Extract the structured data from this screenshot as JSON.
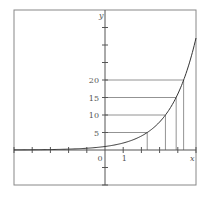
{
  "chart_data": {
    "type": "line",
    "title": "",
    "function": "y = 2^x",
    "xlabel": "x",
    "ylabel": "y",
    "xlim": [
      -5,
      5
    ],
    "ylim": [
      -10,
      40
    ],
    "grid": false,
    "x_ticks": [
      -5,
      -4,
      -3,
      -2,
      -1,
      0,
      1,
      2,
      3,
      4,
      5
    ],
    "x_tick_labels": [
      {
        "value": 0,
        "label": "0"
      },
      {
        "value": 1,
        "label": "1"
      }
    ],
    "y_ticks": [
      -10,
      -5,
      5,
      10,
      15,
      20,
      25,
      30,
      35
    ],
    "y_tick_labels": [
      {
        "value": 5,
        "label": "5"
      },
      {
        "value": 10,
        "label": "10"
      },
      {
        "value": 15,
        "label": "15"
      },
      {
        "value": 20,
        "label": "20"
      }
    ],
    "series": [
      {
        "name": "2^x",
        "x": [
          -5,
          -4,
          -3,
          -2,
          -1,
          0,
          1,
          2,
          3,
          4,
          5
        ],
        "values": [
          0.03125,
          0.0625,
          0.125,
          0.25,
          0.5,
          1,
          2,
          4,
          8,
          16,
          32
        ]
      }
    ],
    "guide_lines": [
      {
        "y": 5,
        "x": 2.32
      },
      {
        "y": 10,
        "x": 3.32
      },
      {
        "y": 15,
        "x": 3.91
      },
      {
        "y": 20,
        "x": 4.32
      }
    ],
    "colors": {
      "axis": "#555555",
      "curve": "#333333",
      "guide": "#777777",
      "frame": "#888888"
    }
  }
}
